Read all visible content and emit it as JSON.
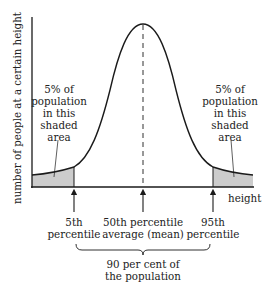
{
  "diagram": {
    "type": "normal-distribution",
    "y_axis_label": "number of people at a certain height",
    "x_axis_label": "height",
    "left_tail": {
      "lines": [
        "5% of",
        "population",
        "in this",
        "shaded",
        "area"
      ]
    },
    "right_tail": {
      "lines": [
        "5% of",
        "population",
        "in this",
        "shaded",
        "area"
      ]
    },
    "markers": [
      {
        "id": "p5",
        "lines": [
          "5th",
          "percentile"
        ]
      },
      {
        "id": "p50",
        "lines": [
          "50th percentile",
          "average (mean)"
        ]
      },
      {
        "id": "p95",
        "lines": [
          "95th",
          "percentile"
        ]
      }
    ],
    "brace_label": [
      "90 per cent of",
      "the population"
    ],
    "colors": {
      "curve": "#1a1a1a",
      "shade": "#cccccc",
      "text": "#222222"
    }
  }
}
